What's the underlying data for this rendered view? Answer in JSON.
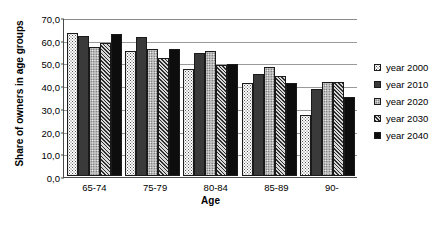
{
  "chart_data": {
    "type": "bar",
    "title": "",
    "xlabel": "Age",
    "ylabel": "Share of owners in age groups",
    "categories": [
      "65-74",
      "75-79",
      "80-84",
      "85-89",
      "90-"
    ],
    "ylim": [
      0.0,
      70.0
    ],
    "yticks": [
      "0,0",
      "10,0",
      "20,0",
      "30,0",
      "40,0",
      "50,0",
      "60,0",
      "70,0"
    ],
    "ytick_values": [
      0.0,
      10.0,
      20.0,
      30.0,
      40.0,
      50.0,
      60.0,
      70.0
    ],
    "grid": true,
    "legend_position": "right",
    "series": [
      {
        "name": "year 2000",
        "fill": "white-dotted",
        "color": "#ffffff",
        "values": [
          63.0,
          55.0,
          47.0,
          41.0,
          27.0
        ]
      },
      {
        "name": "year 2010",
        "fill": "dark-textured",
        "color": "#3a3a3a",
        "values": [
          61.5,
          61.0,
          54.0,
          45.0,
          38.5
        ]
      },
      {
        "name": "year 2020",
        "fill": "light-dotted",
        "color": "#b9b9b9",
        "values": [
          57.0,
          56.0,
          55.0,
          48.0,
          41.5
        ]
      },
      {
        "name": "year 2030",
        "fill": "diagonal-hatch",
        "color": "#cfcfcf",
        "values": [
          58.5,
          52.0,
          49.0,
          44.0,
          41.5
        ]
      },
      {
        "name": "year 2040",
        "fill": "solid-black",
        "color": "#0d0d0d",
        "values": [
          62.5,
          56.0,
          49.5,
          41.0,
          35.0
        ]
      }
    ]
  }
}
